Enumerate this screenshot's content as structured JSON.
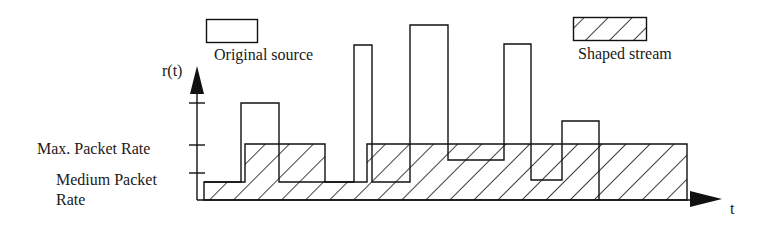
{
  "legend": {
    "original_label": "Original source",
    "shaped_label": "Shaped stream"
  },
  "axes": {
    "y_label": "r(t)",
    "x_label": "t"
  },
  "levels": {
    "max_label": "Max. Packet Rate",
    "medium_label_line1": "Medium Packet",
    "medium_label_line2": "Rate"
  },
  "colors": {
    "stroke": "#111111",
    "background": "#ffffff"
  },
  "diagram": {
    "original_source_segments": [
      {
        "x0": 204,
        "x1": 241,
        "top": 182
      },
      {
        "x0": 241,
        "x1": 279,
        "top": 103
      },
      {
        "x0": 279,
        "x1": 354,
        "top": 182
      },
      {
        "x0": 354,
        "x1": 372,
        "top": 45
      },
      {
        "x0": 372,
        "x1": 410,
        "top": 182
      },
      {
        "x0": 410,
        "x1": 448,
        "top": 25
      },
      {
        "x0": 448,
        "x1": 504,
        "top": 160
      },
      {
        "x0": 504,
        "x1": 531,
        "top": 44
      },
      {
        "x0": 531,
        "x1": 562,
        "top": 180
      },
      {
        "x0": 562,
        "x1": 599,
        "top": 121
      }
    ],
    "shaped_stream_segments": [
      {
        "x0": 204,
        "x1": 245,
        "level": "medium"
      },
      {
        "x0": 245,
        "x1": 325,
        "level": "max"
      },
      {
        "x0": 325,
        "x1": 367,
        "level": "medium"
      },
      {
        "x0": 367,
        "x1": 687,
        "level": "max"
      }
    ]
  }
}
